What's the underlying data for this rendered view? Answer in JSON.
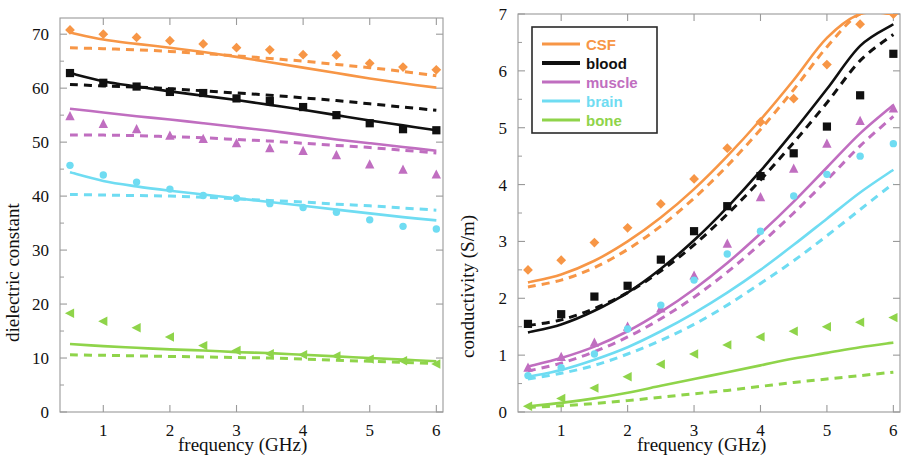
{
  "figure": {
    "panels": [
      "left",
      "right"
    ],
    "background": "#ffffff"
  },
  "colors": {
    "CSF": "#f79646",
    "blood": "#101010",
    "muscle": "#c06ec0",
    "brain": "#6fdcf2",
    "bone": "#8fd44a",
    "axis": "#9a9a9a",
    "text": "#111111"
  },
  "legend": {
    "position": "upper-left-of-right-panel",
    "entries": [
      {
        "label": "CSF",
        "color": "#f79646",
        "marker": "diamond"
      },
      {
        "label": "blood",
        "color": "#101010",
        "marker": "square"
      },
      {
        "label": "muscle",
        "color": "#c06ec0",
        "marker": "triangle"
      },
      {
        "label": "brain",
        "color": "#6fdcf2",
        "marker": "circle"
      },
      {
        "label": "bone",
        "color": "#8fd44a",
        "marker": "left-triangle"
      }
    ]
  },
  "chart_data": [
    {
      "type": "line",
      "panel": "left",
      "title": "",
      "xlabel": "frequency (GHz)",
      "ylabel": "dielectric constant",
      "xlim": [
        0.35,
        6.1
      ],
      "ylim": [
        0,
        73
      ],
      "xticks": [
        1,
        2,
        3,
        4,
        5,
        6
      ],
      "yticks": [
        0,
        10,
        20,
        30,
        40,
        50,
        60,
        70
      ],
      "xticklabels": [
        "1",
        "2",
        "3",
        "4",
        "5",
        "6"
      ],
      "yticklabels": [
        "0",
        "10",
        "20",
        "30",
        "40",
        "50",
        "60",
        "70"
      ],
      "grid": false,
      "legend_position": "none",
      "x": [
        0.5,
        1.0,
        1.5,
        2.0,
        2.5,
        3.0,
        3.5,
        4.0,
        4.5,
        5.0,
        5.5,
        6.0
      ],
      "series": [
        {
          "name": "CSF",
          "color": "#f79646",
          "style": "solid",
          "marker": "none",
          "values": [
            70.3,
            69.0,
            68.2,
            67.5,
            66.7,
            65.8,
            64.8,
            63.8,
            62.8,
            61.8,
            60.9,
            60.1
          ]
        },
        {
          "name": "CSF-model",
          "color": "#f79646",
          "style": "dashed",
          "marker": "none",
          "values": [
            67.5,
            67.3,
            67.1,
            66.8,
            66.4,
            66.0,
            65.5,
            65.0,
            64.4,
            63.8,
            63.1,
            62.3
          ]
        },
        {
          "name": "CSF-measured",
          "color": "#f79646",
          "style": "none",
          "marker": "diamond",
          "values": [
            70.8,
            70.0,
            69.4,
            68.8,
            68.2,
            67.5,
            67.1,
            66.2,
            66.1,
            64.6,
            63.9,
            63.4
          ]
        },
        {
          "name": "blood",
          "color": "#101010",
          "style": "solid",
          "marker": "none",
          "values": [
            62.8,
            61.3,
            60.3,
            59.4,
            58.6,
            57.8,
            56.9,
            56.0,
            55.0,
            54.0,
            53.1,
            52.2
          ]
        },
        {
          "name": "blood-model",
          "color": "#101010",
          "style": "dashed",
          "marker": "none",
          "values": [
            60.7,
            60.4,
            60.2,
            59.9,
            59.5,
            59.1,
            58.7,
            58.2,
            57.7,
            57.1,
            56.5,
            55.9
          ]
        },
        {
          "name": "blood-measured",
          "color": "#101010",
          "style": "none",
          "marker": "square",
          "values": [
            62.8,
            61.0,
            60.3,
            59.3,
            59.1,
            58.1,
            57.6,
            56.5,
            55.0,
            53.5,
            52.4,
            52.2
          ]
        },
        {
          "name": "muscle",
          "color": "#c06ec0",
          "style": "solid",
          "marker": "none",
          "values": [
            56.2,
            55.5,
            54.8,
            54.2,
            53.5,
            52.8,
            52.1,
            51.3,
            50.5,
            49.8,
            49.1,
            48.4
          ]
        },
        {
          "name": "muscle-model",
          "color": "#c06ec0",
          "style": "dashed",
          "marker": "none",
          "values": [
            51.3,
            51.3,
            51.2,
            51.0,
            50.8,
            50.5,
            50.2,
            49.8,
            49.4,
            49.0,
            48.5,
            48.0
          ]
        },
        {
          "name": "muscle-measured",
          "color": "#c06ec0",
          "style": "none",
          "marker": "triangle",
          "values": [
            54.8,
            53.4,
            52.4,
            51.2,
            50.6,
            49.8,
            48.9,
            48.4,
            47.6,
            45.9,
            44.9,
            44.0
          ]
        },
        {
          "name": "brain",
          "color": "#6fdcf2",
          "style": "solid",
          "marker": "none",
          "values": [
            44.4,
            42.8,
            41.8,
            41.0,
            40.3,
            39.6,
            38.9,
            38.2,
            37.5,
            36.8,
            36.1,
            35.5
          ]
        },
        {
          "name": "brain-model",
          "color": "#6fdcf2",
          "style": "dashed",
          "marker": "none",
          "values": [
            40.3,
            40.2,
            40.1,
            40.0,
            39.8,
            39.5,
            39.2,
            38.9,
            38.5,
            38.2,
            37.8,
            37.4
          ]
        },
        {
          "name": "brain-measured",
          "color": "#6fdcf2",
          "style": "none",
          "marker": "circle",
          "values": [
            45.7,
            43.9,
            42.6,
            41.3,
            40.1,
            39.6,
            38.6,
            37.9,
            37.0,
            35.6,
            34.4,
            33.9
          ]
        },
        {
          "name": "bone",
          "color": "#8fd44a",
          "style": "solid",
          "marker": "none",
          "values": [
            12.6,
            12.2,
            11.9,
            11.6,
            11.4,
            11.1,
            10.9,
            10.6,
            10.3,
            10.0,
            9.7,
            9.4
          ]
        },
        {
          "name": "bone-model",
          "color": "#8fd44a",
          "style": "dashed",
          "marker": "none",
          "values": [
            10.6,
            10.5,
            10.4,
            10.3,
            10.2,
            10.1,
            10.0,
            9.8,
            9.6,
            9.4,
            9.2,
            9.0
          ]
        },
        {
          "name": "bone-measured",
          "color": "#8fd44a",
          "style": "none",
          "marker": "left-triangle",
          "values": [
            18.3,
            16.8,
            15.6,
            13.9,
            12.3,
            11.4,
            10.8,
            10.6,
            10.4,
            9.8,
            9.5,
            8.9
          ]
        }
      ]
    },
    {
      "type": "line",
      "panel": "right",
      "title": "",
      "xlabel": "frequency (GHz)",
      "ylabel": "conductivity (S/m)",
      "xlim": [
        0.35,
        6.1
      ],
      "ylim": [
        0,
        7
      ],
      "xticks": [
        1,
        2,
        3,
        4,
        5,
        6
      ],
      "yticks": [
        0,
        1,
        2,
        3,
        4,
        5,
        6,
        7
      ],
      "xticklabels": [
        "1",
        "2",
        "3",
        "4",
        "5",
        "6"
      ],
      "yticklabels": [
        "0",
        "1",
        "2",
        "3",
        "4",
        "5",
        "6",
        "7"
      ],
      "grid": false,
      "legend_position": "upper left",
      "x": [
        0.5,
        1.0,
        1.5,
        2.0,
        2.5,
        3.0,
        3.5,
        4.0,
        4.5,
        5.0,
        5.5,
        6.0
      ],
      "series": [
        {
          "name": "CSF",
          "color": "#f79646",
          "style": "solid",
          "marker": "none",
          "values": [
            2.28,
            2.42,
            2.66,
            3.0,
            3.42,
            3.92,
            4.5,
            5.14,
            5.84,
            6.58,
            7.0,
            7.0
          ]
        },
        {
          "name": "CSF-model",
          "color": "#f79646",
          "style": "dashed",
          "marker": "none",
          "values": [
            2.2,
            2.32,
            2.54,
            2.86,
            3.27,
            3.76,
            4.33,
            4.97,
            5.67,
            6.42,
            7.0,
            7.0
          ]
        },
        {
          "name": "CSF-measured",
          "color": "#f79646",
          "style": "none",
          "marker": "diamond",
          "values": [
            2.5,
            2.67,
            2.98,
            3.24,
            3.66,
            4.1,
            4.64,
            5.1,
            5.51,
            6.11,
            6.82,
            7.0
          ]
        },
        {
          "name": "blood",
          "color": "#101010",
          "style": "solid",
          "marker": "none",
          "values": [
            1.4,
            1.54,
            1.78,
            2.1,
            2.52,
            3.02,
            3.6,
            4.24,
            4.94,
            5.68,
            6.44,
            6.82
          ]
        },
        {
          "name": "blood-model",
          "color": "#101010",
          "style": "dashed",
          "marker": "none",
          "values": [
            1.52,
            1.62,
            1.82,
            2.1,
            2.48,
            2.94,
            3.48,
            4.08,
            4.74,
            5.44,
            6.18,
            6.64
          ]
        },
        {
          "name": "blood-measured",
          "color": "#101010",
          "style": "none",
          "marker": "square",
          "values": [
            1.55,
            1.72,
            2.03,
            2.22,
            2.68,
            3.18,
            3.62,
            4.15,
            4.55,
            5.02,
            5.57,
            6.3
          ]
        },
        {
          "name": "muscle",
          "color": "#c06ec0",
          "style": "solid",
          "marker": "none",
          "values": [
            0.8,
            0.95,
            1.15,
            1.42,
            1.76,
            2.16,
            2.62,
            3.14,
            3.7,
            4.3,
            4.9,
            5.4
          ]
        },
        {
          "name": "muscle-model",
          "color": "#c06ec0",
          "style": "dashed",
          "marker": "none",
          "values": [
            0.72,
            0.86,
            1.06,
            1.32,
            1.64,
            2.02,
            2.46,
            2.96,
            3.5,
            4.08,
            4.68,
            5.2
          ]
        },
        {
          "name": "muscle-measured",
          "color": "#c06ec0",
          "style": "none",
          "marker": "triangle",
          "values": [
            0.78,
            0.97,
            1.22,
            1.5,
            1.82,
            2.4,
            2.96,
            3.78,
            4.28,
            4.72,
            5.12,
            5.34
          ]
        },
        {
          "name": "brain",
          "color": "#6fdcf2",
          "style": "solid",
          "marker": "none",
          "values": [
            0.62,
            0.74,
            0.92,
            1.14,
            1.42,
            1.74,
            2.1,
            2.5,
            2.94,
            3.4,
            3.86,
            4.26
          ]
        },
        {
          "name": "brain-model",
          "color": "#6fdcf2",
          "style": "dashed",
          "marker": "none",
          "values": [
            0.58,
            0.68,
            0.82,
            1.02,
            1.26,
            1.54,
            1.88,
            2.26,
            2.66,
            3.1,
            3.56,
            4.02
          ]
        },
        {
          "name": "brain-measured",
          "color": "#6fdcf2",
          "style": "none",
          "marker": "circle",
          "values": [
            0.64,
            0.78,
            1.02,
            1.46,
            1.88,
            2.32,
            2.78,
            3.18,
            3.8,
            4.18,
            4.5,
            4.72
          ]
        },
        {
          "name": "bone",
          "color": "#8fd44a",
          "style": "solid",
          "marker": "none",
          "values": [
            0.1,
            0.16,
            0.24,
            0.34,
            0.46,
            0.58,
            0.7,
            0.82,
            0.94,
            1.04,
            1.14,
            1.22
          ]
        },
        {
          "name": "bone-model",
          "color": "#8fd44a",
          "style": "dashed",
          "marker": "none",
          "values": [
            0.08,
            0.11,
            0.15,
            0.2,
            0.26,
            0.32,
            0.38,
            0.45,
            0.52,
            0.58,
            0.64,
            0.7
          ]
        },
        {
          "name": "bone-measured",
          "color": "#8fd44a",
          "style": "none",
          "marker": "left-triangle",
          "values": [
            0.1,
            0.24,
            0.42,
            0.62,
            0.84,
            1.02,
            1.18,
            1.32,
            1.42,
            1.5,
            1.58,
            1.66
          ]
        }
      ]
    }
  ]
}
